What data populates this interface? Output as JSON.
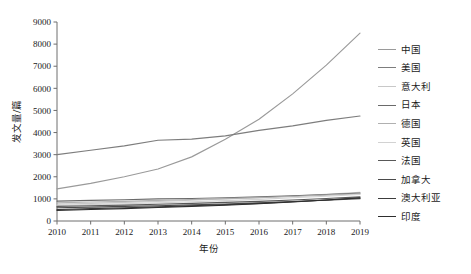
{
  "chart_data": {
    "type": "line",
    "title": "",
    "xlabel": "年份",
    "ylabel": "发文量/篇",
    "x": [
      2010,
      2011,
      2012,
      2013,
      2014,
      2015,
      2016,
      2017,
      2018,
      2019
    ],
    "xtick_labels": [
      "2010",
      "2011",
      "2012",
      "2013",
      "2014",
      "2015",
      "2016",
      "2017",
      "2018",
      "2019"
    ],
    "ytick_labels": [
      "0",
      "1000",
      "2000",
      "3000",
      "4000",
      "5000",
      "6000",
      "7000",
      "8000",
      "9000"
    ],
    "yticks": [
      0,
      1000,
      2000,
      3000,
      4000,
      5000,
      6000,
      7000,
      8000,
      9000
    ],
    "ylim": [
      0,
      9000
    ],
    "xlim": [
      2010,
      2019
    ],
    "grid": false,
    "legend_position": "right",
    "series": [
      {
        "name": "中国",
        "color": "#9a9a9a",
        "values": [
          1450,
          1700,
          2000,
          2350,
          2900,
          3700,
          4600,
          5750,
          7050,
          8500
        ]
      },
      {
        "name": "美国",
        "color": "#7d7d7d",
        "values": [
          3000,
          3200,
          3400,
          3650,
          3700,
          3850,
          4100,
          4300,
          4550,
          4750
        ]
      },
      {
        "name": "意大利",
        "color": "#c8c8c8",
        "values": [
          760,
          800,
          840,
          880,
          940,
          1000,
          1060,
          1130,
          1210,
          1300
        ]
      },
      {
        "name": "日本",
        "color": "#6a6a6a",
        "values": [
          900,
          930,
          960,
          1000,
          1020,
          1050,
          1090,
          1140,
          1200,
          1260
        ]
      },
      {
        "name": "德国",
        "color": "#b0b0b0",
        "values": [
          820,
          860,
          890,
          930,
          970,
          1010,
          1060,
          1110,
          1170,
          1230
        ]
      },
      {
        "name": "英国",
        "color": "#d2d2d2",
        "values": [
          700,
          740,
          780,
          820,
          870,
          920,
          980,
          1050,
          1120,
          1200
        ]
      },
      {
        "name": "法国",
        "color": "#585858",
        "values": [
          660,
          690,
          720,
          760,
          800,
          840,
          890,
          950,
          1020,
          1090
        ]
      },
      {
        "name": "加拿大",
        "color": "#4a4a4a",
        "values": [
          600,
          630,
          660,
          690,
          730,
          770,
          820,
          880,
          940,
          1010
        ]
      },
      {
        "name": "澳大利亚",
        "color": "#3c3c3c",
        "values": [
          520,
          560,
          600,
          640,
          690,
          740,
          800,
          870,
          950,
          1040
        ]
      },
      {
        "name": "印度",
        "color": "#2e2e2e",
        "values": [
          480,
          520,
          560,
          610,
          660,
          710,
          780,
          860,
          950,
          1050
        ]
      }
    ]
  }
}
